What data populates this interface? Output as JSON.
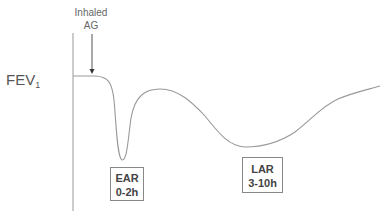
{
  "diagram": {
    "y_axis_label": "FEV",
    "y_axis_subscript": "1",
    "annotation": {
      "line1": "Inhaled",
      "line2": "AG"
    },
    "phases": [
      {
        "name": "EAR",
        "time": "0-2h"
      },
      {
        "name": "LAR",
        "time": "3-10h"
      }
    ],
    "colors": {
      "curve": "#999999",
      "axis": "#999999",
      "text": "#555555",
      "box_border": "#888888"
    }
  }
}
